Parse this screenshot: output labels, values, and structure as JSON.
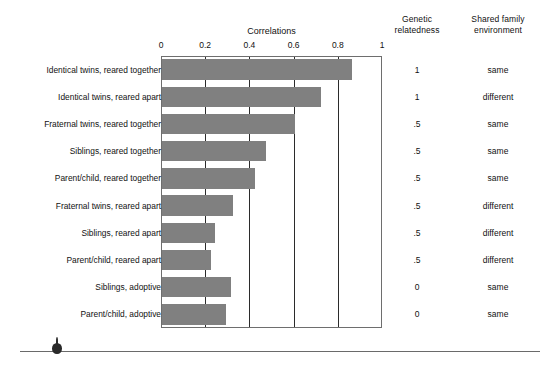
{
  "chart_data": {
    "type": "bar",
    "orientation": "horizontal",
    "title": "Correlations",
    "xlabel": "",
    "ylabel": "",
    "xlim": [
      0,
      1
    ],
    "grid": true,
    "legend": null,
    "xticks": [
      "0",
      "0.2",
      "0.4",
      "0.6",
      "0.8",
      "1"
    ],
    "xtick_values": [
      0,
      0.2,
      0.4,
      0.6,
      0.8,
      1
    ],
    "categories": [
      "Identical twins, reared together",
      "Identical twins, reared apart",
      "Fraternal twins, reared together",
      "Siblings, reared together",
      "Parent/child, reared together",
      "Fraternal twins, reared apart",
      "Siblings, reared apart",
      "Parent/child, reared apart",
      "Siblings, adoptive",
      "Parent/child, adoptive"
    ],
    "values": [
      0.86,
      0.72,
      0.6,
      0.47,
      0.42,
      0.32,
      0.24,
      0.22,
      0.31,
      0.29
    ],
    "bar_color": "#808080"
  },
  "columns": {
    "genetic_header": "Genetic\nrelatedness",
    "genetic_header_line1": "Genetic",
    "genetic_header_line2": "relatedness",
    "shared_header_line1": "Shared family",
    "shared_header_line2": "environment"
  },
  "rows": [
    {
      "label": "Identical twins, reared together",
      "value": 0.86,
      "genetic": "1",
      "shared": "same"
    },
    {
      "label": "Identical twins, reared apart",
      "value": 0.72,
      "genetic": "1",
      "shared": "different"
    },
    {
      "label": "Fraternal twins, reared together",
      "value": 0.6,
      "genetic": ".5",
      "shared": "same"
    },
    {
      "label": "Siblings, reared together",
      "value": 0.47,
      "genetic": ".5",
      "shared": "same"
    },
    {
      "label": "Parent/child, reared together",
      "value": 0.42,
      "genetic": ".5",
      "shared": "same"
    },
    {
      "label": "Fraternal twins, reared apart",
      "value": 0.32,
      "genetic": ".5",
      "shared": "different"
    },
    {
      "label": "Siblings, reared apart",
      "value": 0.24,
      "genetic": ".5",
      "shared": "different"
    },
    {
      "label": "Parent/child, reared apart",
      "value": 0.22,
      "genetic": ".5",
      "shared": "different"
    },
    {
      "label": "Siblings, adoptive",
      "value": 0.31,
      "genetic": "0",
      "shared": "same"
    },
    {
      "label": "Parent/child, adoptive",
      "value": 0.29,
      "genetic": "0",
      "shared": "same"
    }
  ],
  "colors": {
    "bar": "#808080",
    "gridline": "#2b2b2b",
    "frame": "#6e6e6e",
    "text": "#111111",
    "rule": "#6a6a6a",
    "marker": "#2a2a2a"
  }
}
